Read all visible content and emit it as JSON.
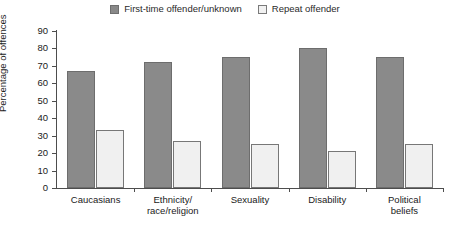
{
  "chart_data": {
    "type": "bar",
    "title": "",
    "xlabel": "",
    "ylabel": "Percentage of offences",
    "ylim": [
      0,
      90
    ],
    "ytick_step": 10,
    "yticks": [
      90,
      80,
      70,
      60,
      50,
      40,
      30,
      20,
      10,
      0
    ],
    "grid": false,
    "legend_position": "top-center",
    "categories": [
      "Caucasians",
      "Ethnicity/\nrace/religion",
      "Sexuality",
      "Disability",
      "Political\nbeliefs"
    ],
    "series": [
      {
        "name": "First-time offender/unknown",
        "color": "#8a8a8a",
        "values": [
          67,
          72,
          75,
          80,
          75
        ]
      },
      {
        "name": "Repeat offender",
        "color": "#f0f0f0",
        "values": [
          33,
          27,
          25,
          21,
          25
        ]
      }
    ]
  },
  "legend": {
    "items": [
      {
        "label": "First-time offender/unknown",
        "swatch": "series-dark"
      },
      {
        "label": "Repeat offender",
        "swatch": "series-light"
      }
    ]
  },
  "axes": {
    "y_title": "Percentage of offences",
    "y_labels": [
      "90",
      "80",
      "70",
      "60",
      "50",
      "40",
      "30",
      "20",
      "10",
      "0"
    ],
    "x_labels": [
      {
        "line1": "Caucasians",
        "line2": ""
      },
      {
        "line1": "Ethnicity/",
        "line2": "race/religion"
      },
      {
        "line1": "Sexuality",
        "line2": ""
      },
      {
        "line1": "Disability",
        "line2": ""
      },
      {
        "line1": "Political",
        "line2": "beliefs"
      }
    ]
  }
}
